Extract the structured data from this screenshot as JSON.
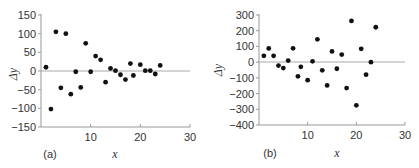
{
  "chart_data": [
    {
      "type": "scatter",
      "panel_label": "(a)",
      "title": "",
      "xlabel": "x",
      "ylabel": "Δy",
      "xlim": [
        0,
        30
      ],
      "ylim": [
        -150,
        150
      ],
      "xticks": [
        10,
        20,
        30
      ],
      "yticks": [
        150,
        100,
        50,
        0,
        -50,
        -100,
        -150
      ],
      "grid": false,
      "zero_line": true,
      "x": [
        1,
        2,
        3,
        4,
        5,
        6,
        7,
        8,
        9,
        10,
        11,
        12,
        13,
        14,
        15,
        16,
        17,
        18,
        18.6,
        20,
        21,
        22,
        23,
        24
      ],
      "y": [
        10,
        -102,
        105,
        -45,
        100,
        -62,
        -2,
        -44,
        74,
        -2,
        40,
        30,
        -30,
        7,
        1,
        -10,
        -23,
        20,
        -12,
        17,
        1,
        1,
        -8,
        15
      ]
    },
    {
      "type": "scatter",
      "panel_label": "(b)",
      "title": "",
      "xlabel": "x",
      "ylabel": "Δy",
      "xlim": [
        0,
        30
      ],
      "ylim": [
        -400,
        300
      ],
      "xticks": [
        10,
        20,
        30
      ],
      "yticks": [
        300,
        200,
        100,
        0,
        -100,
        -200,
        -300,
        -400
      ],
      "grid": false,
      "zero_line": true,
      "x": [
        1,
        2,
        3,
        4,
        5,
        6,
        7,
        8,
        8.6,
        10,
        11,
        12,
        13,
        14,
        15,
        16,
        17,
        18,
        19,
        20,
        21,
        22,
        23,
        24
      ],
      "y": [
        40,
        87,
        40,
        -22,
        -38,
        10,
        88,
        -90,
        -30,
        -115,
        5,
        145,
        -52,
        -148,
        68,
        -42,
        48,
        -165,
        262,
        -275,
        85,
        -80,
        0,
        222
      ]
    }
  ]
}
